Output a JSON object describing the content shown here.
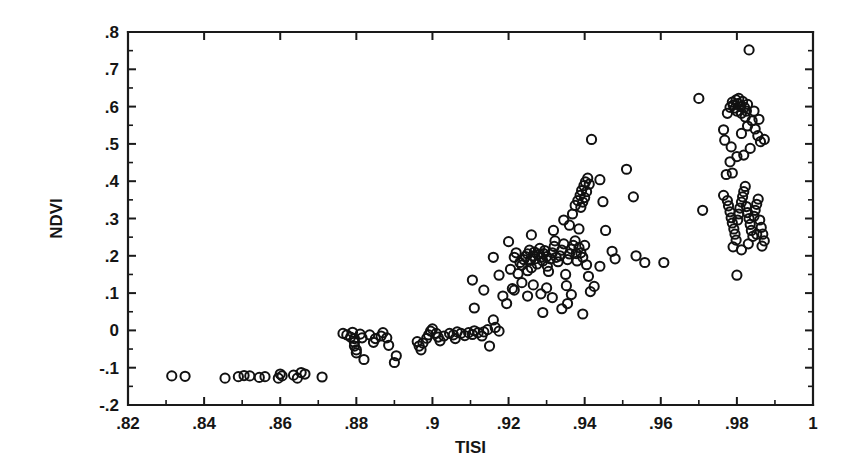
{
  "chart_data": {
    "type": "scatter",
    "title": "",
    "xlabel": "TISI",
    "ylabel": "NDVI",
    "xlim": [
      0.82,
      1.0
    ],
    "ylim": [
      -0.2,
      0.8
    ],
    "grid": false,
    "legend": null,
    "marker": {
      "shape": "open-circle",
      "radius": 4.6,
      "color": "#111111",
      "fill": "none"
    },
    "x_ticks_major": [
      0.82,
      0.84,
      0.86,
      0.88,
      0.9,
      0.92,
      0.94,
      0.96,
      0.98,
      1.0
    ],
    "x_tick_labels": [
      ".82",
      ".84",
      ".86",
      ".88",
      ".9",
      ".92",
      ".94",
      ".96",
      ".98",
      "1"
    ],
    "x_ticks_minor": [
      0.83,
      0.85,
      0.87,
      0.89,
      0.91,
      0.93,
      0.95,
      0.97,
      0.99
    ],
    "y_ticks_major": [
      -0.2,
      -0.1,
      0,
      0.1,
      0.2,
      0.3,
      0.4,
      0.5,
      0.6,
      0.7,
      0.8
    ],
    "y_tick_labels": [
      "-.2",
      "-.1",
      "0",
      ".1",
      ".2",
      ".3",
      ".4",
      ".5",
      ".6",
      ".7",
      ".8"
    ],
    "y_ticks_minor": [
      -0.15,
      -0.05,
      0.05,
      0.15,
      0.25,
      0.35,
      0.45,
      0.55,
      0.65,
      0.75
    ],
    "n_points": 198,
    "points": [
      [
        0.8315,
        -0.122
      ],
      [
        0.835,
        -0.123
      ],
      [
        0.8455,
        -0.128
      ],
      [
        0.849,
        -0.124
      ],
      [
        0.8505,
        -0.121
      ],
      [
        0.852,
        -0.122
      ],
      [
        0.8545,
        -0.126
      ],
      [
        0.856,
        -0.124
      ],
      [
        0.8595,
        -0.128
      ],
      [
        0.86,
        -0.117
      ],
      [
        0.8605,
        -0.122
      ],
      [
        0.8635,
        -0.12
      ],
      [
        0.8645,
        -0.128
      ],
      [
        0.8655,
        -0.113
      ],
      [
        0.8665,
        -0.117
      ],
      [
        0.871,
        -0.125
      ],
      [
        0.8765,
        -0.008
      ],
      [
        0.8775,
        -0.012
      ],
      [
        0.8785,
        -0.018
      ],
      [
        0.879,
        -0.005
      ],
      [
        0.8795,
        -0.022
      ],
      [
        0.8795,
        -0.032
      ],
      [
        0.8795,
        -0.042
      ],
      [
        0.88,
        -0.052
      ],
      [
        0.88,
        -0.06
      ],
      [
        0.881,
        -0.01
      ],
      [
        0.8815,
        -0.02
      ],
      [
        0.882,
        -0.078
      ],
      [
        0.8835,
        -0.012
      ],
      [
        0.8845,
        -0.032
      ],
      [
        0.885,
        -0.022
      ],
      [
        0.8865,
        -0.015
      ],
      [
        0.887,
        -0.006
      ],
      [
        0.888,
        -0.02
      ],
      [
        0.8885,
        -0.04
      ],
      [
        0.8905,
        -0.068
      ],
      [
        0.89,
        -0.086
      ],
      [
        0.896,
        -0.03
      ],
      [
        0.8965,
        -0.042
      ],
      [
        0.897,
        -0.052
      ],
      [
        0.8975,
        -0.034
      ],
      [
        0.8985,
        -0.021
      ],
      [
        0.899,
        -0.012
      ],
      [
        0.8995,
        -0.002
      ],
      [
        0.9,
        0.004
      ],
      [
        0.901,
        -0.008
      ],
      [
        0.9015,
        -0.018
      ],
      [
        0.902,
        -0.028
      ],
      [
        0.903,
        -0.015
      ],
      [
        0.9045,
        -0.008
      ],
      [
        0.9055,
        -0.012
      ],
      [
        0.906,
        -0.022
      ],
      [
        0.9065,
        -0.004
      ],
      [
        0.9075,
        -0.008
      ],
      [
        0.9085,
        -0.014
      ],
      [
        0.9095,
        -0.006
      ],
      [
        0.9105,
        -0.011
      ],
      [
        0.911,
        -0.001
      ],
      [
        0.912,
        -0.006
      ],
      [
        0.913,
        -0.015
      ],
      [
        0.9135,
        -0.004
      ],
      [
        0.9145,
        0.002
      ],
      [
        0.915,
        -0.042
      ],
      [
        0.916,
        0.028
      ],
      [
        0.9165,
        0.008
      ],
      [
        0.9175,
        -0.002
      ],
      [
        0.9105,
        0.135
      ],
      [
        0.911,
        0.06
      ],
      [
        0.9135,
        0.108
      ],
      [
        0.916,
        0.196
      ],
      [
        0.9175,
        0.148
      ],
      [
        0.9185,
        0.092
      ],
      [
        0.9195,
        0.072
      ],
      [
        0.9205,
        0.164
      ],
      [
        0.921,
        0.112
      ],
      [
        0.9215,
        0.196
      ],
      [
        0.922,
        0.208
      ],
      [
        0.9225,
        0.152
      ],
      [
        0.923,
        0.182
      ],
      [
        0.9235,
        0.175
      ],
      [
        0.924,
        0.19
      ],
      [
        0.9245,
        0.198
      ],
      [
        0.925,
        0.205
      ],
      [
        0.925,
        0.16
      ],
      [
        0.9255,
        0.215
      ],
      [
        0.9258,
        0.188
      ],
      [
        0.926,
        0.168
      ],
      [
        0.9265,
        0.2
      ],
      [
        0.9268,
        0.21
      ],
      [
        0.927,
        0.192
      ],
      [
        0.9275,
        0.178
      ],
      [
        0.928,
        0.204
      ],
      [
        0.9282,
        0.22
      ],
      [
        0.9285,
        0.196
      ],
      [
        0.929,
        0.186
      ],
      [
        0.9292,
        0.206
      ],
      [
        0.9295,
        0.214
      ],
      [
        0.93,
        0.198
      ],
      [
        0.9302,
        0.172
      ],
      [
        0.9305,
        0.158
      ],
      [
        0.931,
        0.192
      ],
      [
        0.9315,
        0.208
      ],
      [
        0.932,
        0.225
      ],
      [
        0.9322,
        0.24
      ],
      [
        0.9325,
        0.196
      ],
      [
        0.933,
        0.184
      ],
      [
        0.9335,
        0.2
      ],
      [
        0.934,
        0.215
      ],
      [
        0.9345,
        0.232
      ],
      [
        0.935,
        0.15
      ],
      [
        0.9352,
        0.12
      ],
      [
        0.9355,
        0.19
      ],
      [
        0.936,
        0.205
      ],
      [
        0.9365,
        0.218
      ],
      [
        0.937,
        0.228
      ],
      [
        0.9375,
        0.24
      ],
      [
        0.9378,
        0.206
      ],
      [
        0.938,
        0.186
      ],
      [
        0.9385,
        0.222
      ],
      [
        0.939,
        0.208
      ],
      [
        0.9395,
        0.196
      ],
      [
        0.94,
        0.228
      ],
      [
        0.9405,
        0.176
      ],
      [
        0.941,
        0.145
      ],
      [
        0.9415,
        0.104
      ],
      [
        0.9215,
        0.108
      ],
      [
        0.9235,
        0.128
      ],
      [
        0.925,
        0.092
      ],
      [
        0.9265,
        0.122
      ],
      [
        0.9285,
        0.098
      ],
      [
        0.93,
        0.114
      ],
      [
        0.9315,
        0.088
      ],
      [
        0.934,
        0.058
      ],
      [
        0.9355,
        0.072
      ],
      [
        0.9365,
        0.096
      ],
      [
        0.929,
        0.048
      ],
      [
        0.9395,
        0.044
      ],
      [
        0.9425,
        0.118
      ],
      [
        0.944,
        0.172
      ],
      [
        0.92,
        0.238
      ],
      [
        0.926,
        0.256
      ],
      [
        0.9318,
        0.268
      ],
      [
        0.936,
        0.282
      ],
      [
        0.9385,
        0.272
      ],
      [
        0.9345,
        0.296
      ],
      [
        0.9368,
        0.312
      ],
      [
        0.9375,
        0.335
      ],
      [
        0.9382,
        0.348
      ],
      [
        0.9388,
        0.362
      ],
      [
        0.9392,
        0.375
      ],
      [
        0.9398,
        0.388
      ],
      [
        0.9402,
        0.398
      ],
      [
        0.9408,
        0.408
      ],
      [
        0.9412,
        0.392
      ],
      [
        0.9405,
        0.372
      ],
      [
        0.94,
        0.356
      ],
      [
        0.9395,
        0.344
      ],
      [
        0.939,
        0.33
      ],
      [
        0.9418,
        0.512
      ],
      [
        0.944,
        0.404
      ],
      [
        0.9448,
        0.345
      ],
      [
        0.9455,
        0.268
      ],
      [
        0.9472,
        0.212
      ],
      [
        0.948,
        0.192
      ],
      [
        0.951,
        0.432
      ],
      [
        0.9528,
        0.358
      ],
      [
        0.9535,
        0.2
      ],
      [
        0.9558,
        0.182
      ],
      [
        0.9608,
        0.182
      ],
      [
        0.97,
        0.622
      ],
      [
        0.971,
        0.322
      ],
      [
        0.9765,
        0.538
      ],
      [
        0.9775,
        0.582
      ],
      [
        0.9782,
        0.598
      ],
      [
        0.9788,
        0.612
      ],
      [
        0.979,
        0.604
      ],
      [
        0.9795,
        0.596
      ],
      [
        0.9798,
        0.618
      ],
      [
        0.98,
        0.588
      ],
      [
        0.9802,
        0.608
      ],
      [
        0.9805,
        0.622
      ],
      [
        0.981,
        0.6
      ],
      [
        0.9812,
        0.582
      ],
      [
        0.9815,
        0.614
      ],
      [
        0.982,
        0.598
      ],
      [
        0.9822,
        0.572
      ],
      [
        0.9825,
        0.588
      ],
      [
        0.9828,
        0.606
      ],
      [
        0.9832,
        0.752
      ],
      [
        0.9768,
        0.51
      ],
      [
        0.9785,
        0.492
      ],
      [
        0.9812,
        0.528
      ],
      [
        0.9828,
        0.548
      ],
      [
        0.984,
        0.562
      ],
      [
        0.9848,
        0.54
      ],
      [
        0.9855,
        0.522
      ],
      [
        0.9862,
        0.506
      ],
      [
        0.9835,
        0.488
      ],
      [
        0.9818,
        0.47
      ],
      [
        0.98,
        0.466
      ],
      [
        0.9782,
        0.452
      ],
      [
        0.9845,
        0.588
      ],
      [
        0.9858,
        0.566
      ],
      [
        0.9872,
        0.512
      ],
      [
        0.9772,
        0.418
      ],
      [
        0.9788,
        0.422
      ],
      [
        0.9765,
        0.362
      ],
      [
        0.9775,
        0.348
      ],
      [
        0.9778,
        0.334
      ],
      [
        0.9782,
        0.318
      ],
      [
        0.9785,
        0.302
      ],
      [
        0.9788,
        0.288
      ],
      [
        0.9792,
        0.272
      ],
      [
        0.9795,
        0.258
      ],
      [
        0.9798,
        0.242
      ],
      [
        0.9802,
        0.296
      ],
      [
        0.9805,
        0.312
      ],
      [
        0.9808,
        0.328
      ],
      [
        0.9812,
        0.344
      ],
      [
        0.9815,
        0.358
      ],
      [
        0.9818,
        0.372
      ],
      [
        0.9822,
        0.386
      ],
      [
        0.9825,
        0.332
      ],
      [
        0.9828,
        0.316
      ],
      [
        0.9832,
        0.3
      ],
      [
        0.9835,
        0.284
      ],
      [
        0.9838,
        0.268
      ],
      [
        0.9842,
        0.252
      ],
      [
        0.9845,
        0.306
      ],
      [
        0.9848,
        0.322
      ],
      [
        0.9852,
        0.338
      ],
      [
        0.9856,
        0.352
      ],
      [
        0.986,
        0.296
      ],
      [
        0.9864,
        0.276
      ],
      [
        0.9868,
        0.258
      ],
      [
        0.9872,
        0.24
      ],
      [
        0.979,
        0.224
      ],
      [
        0.9812,
        0.216
      ],
      [
        0.983,
        0.232
      ],
      [
        0.9852,
        0.258
      ],
      [
        0.9866,
        0.226
      ],
      [
        0.98,
        0.148
      ]
    ]
  },
  "axes": {
    "y_title": "NDVI",
    "x_title": "TISI"
  },
  "colors": {
    "ink": "#111111",
    "background": "#ffffff"
  }
}
